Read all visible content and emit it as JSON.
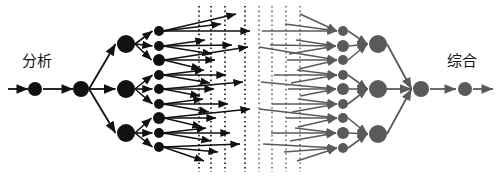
{
  "figure": {
    "title_left": "分析",
    "title_right": "综合",
    "type": "double-tree-divergence-convergence",
    "colors": {
      "analysis": "#111111",
      "synthesis": "#5a5a5a",
      "divider_left": "#111111",
      "divider_right": "#6e6e6e",
      "background": "#ffffff"
    }
  },
  "labels": {
    "left": {
      "text": "分析",
      "x": 22,
      "y": 54
    },
    "right": {
      "text": "综合",
      "x": 447,
      "y": 54
    }
  },
  "chart_data": {
    "type": "diagram",
    "analysis_side": {
      "color": "#111111",
      "entry_arrow": {
        "x1": 8,
        "x2": 28,
        "y": 89
      },
      "level0": {
        "cx": 35,
        "cy": 89,
        "r": 7
      },
      "link_0_1": {
        "x1": 43,
        "x2": 73,
        "y": 89
      },
      "level1": {
        "cx": 81,
        "cy": 89,
        "r": 8
      },
      "level2": [
        {
          "cx": 126,
          "cy": 44,
          "r": 9
        },
        {
          "cx": 126,
          "cy": 89,
          "r": 9
        },
        {
          "cx": 126,
          "cy": 133,
          "r": 9
        }
      ],
      "level3": [
        {
          "cx": 159,
          "cy": 31,
          "r": 5
        },
        {
          "cx": 159,
          "cy": 46,
          "r": 5
        },
        {
          "cx": 159,
          "cy": 60,
          "r": 6
        },
        {
          "cx": 159,
          "cy": 75,
          "r": 5
        },
        {
          "cx": 159,
          "cy": 89,
          "r": 5
        },
        {
          "cx": 159,
          "cy": 104,
          "r": 5
        },
        {
          "cx": 159,
          "cy": 118,
          "r": 6
        },
        {
          "cx": 159,
          "cy": 133,
          "r": 5
        },
        {
          "cx": 159,
          "cy": 147,
          "r": 5
        }
      ],
      "fanout_endpoints": [
        [
          {
            "x": 236,
            "y": 14
          },
          {
            "x": 221,
            "y": 24
          },
          {
            "x": 250,
            "y": 31
          }
        ],
        [
          {
            "x": 205,
            "y": 40
          },
          {
            "x": 232,
            "y": 45
          },
          {
            "x": 212,
            "y": 54
          }
        ],
        [
          {
            "x": 248,
            "y": 47
          },
          {
            "x": 215,
            "y": 60
          },
          {
            "x": 201,
            "y": 69
          }
        ],
        [
          {
            "x": 204,
            "y": 70
          },
          {
            "x": 226,
            "y": 75
          },
          {
            "x": 210,
            "y": 83
          }
        ],
        [
          {
            "x": 243,
            "y": 82
          },
          {
            "x": 214,
            "y": 89
          },
          {
            "x": 200,
            "y": 96
          }
        ],
        [
          {
            "x": 203,
            "y": 99
          },
          {
            "x": 228,
            "y": 104
          },
          {
            "x": 209,
            "y": 112
          }
        ],
        [
          {
            "x": 250,
            "y": 109
          },
          {
            "x": 216,
            "y": 118
          },
          {
            "x": 202,
            "y": 127
          }
        ],
        [
          {
            "x": 206,
            "y": 128
          },
          {
            "x": 230,
            "y": 133
          },
          {
            "x": 211,
            "y": 141
          }
        ],
        [
          {
            "x": 240,
            "y": 144
          },
          {
            "x": 218,
            "y": 152
          },
          {
            "x": 204,
            "y": 161
          }
        ]
      ],
      "divider_lines_x": [
        199,
        211,
        225,
        245
      ]
    },
    "synthesis_side": {
      "color": "#5a5a5a",
      "divider_lines_x": [
        259,
        272,
        286,
        300
      ],
      "fanin_startpoints": [
        [
          {
            "x": 300,
            "y": 14
          },
          {
            "x": 285,
            "y": 24
          },
          {
            "x": 262,
            "y": 31
          }
        ],
        [
          {
            "x": 296,
            "y": 40
          },
          {
            "x": 270,
            "y": 45
          },
          {
            "x": 289,
            "y": 54
          }
        ],
        [
          {
            "x": 259,
            "y": 47
          },
          {
            "x": 287,
            "y": 60
          },
          {
            "x": 299,
            "y": 69
          }
        ],
        [
          {
            "x": 297,
            "y": 70
          },
          {
            "x": 274,
            "y": 75
          },
          {
            "x": 291,
            "y": 83
          }
        ],
        [
          {
            "x": 261,
            "y": 82
          },
          {
            "x": 288,
            "y": 89
          },
          {
            "x": 300,
            "y": 96
          }
        ],
        [
          {
            "x": 298,
            "y": 99
          },
          {
            "x": 272,
            "y": 104
          },
          {
            "x": 292,
            "y": 112
          }
        ],
        [
          {
            "x": 259,
            "y": 109
          },
          {
            "x": 286,
            "y": 118
          },
          {
            "x": 298,
            "y": 127
          }
        ],
        [
          {
            "x": 295,
            "y": 128
          },
          {
            "x": 271,
            "y": 133
          },
          {
            "x": 290,
            "y": 141
          }
        ],
        [
          {
            "x": 263,
            "y": 144
          },
          {
            "x": 284,
            "y": 152
          },
          {
            "x": 297,
            "y": 161
          }
        ]
      ],
      "level3": [
        {
          "cx": 343,
          "cy": 31,
          "r": 5
        },
        {
          "cx": 343,
          "cy": 46,
          "r": 6
        },
        {
          "cx": 343,
          "cy": 60,
          "r": 5
        },
        {
          "cx": 343,
          "cy": 75,
          "r": 5
        },
        {
          "cx": 343,
          "cy": 89,
          "r": 6
        },
        {
          "cx": 343,
          "cy": 104,
          "r": 5
        },
        {
          "cx": 343,
          "cy": 118,
          "r": 5
        },
        {
          "cx": 343,
          "cy": 133,
          "r": 6
        },
        {
          "cx": 343,
          "cy": 148,
          "r": 5
        }
      ],
      "level2": [
        {
          "cx": 378,
          "cy": 44,
          "r": 9
        },
        {
          "cx": 378,
          "cy": 89,
          "r": 9
        },
        {
          "cx": 378,
          "cy": 134,
          "r": 9
        }
      ],
      "level1": {
        "cx": 421,
        "cy": 89,
        "r": 8
      },
      "link_1_0": {
        "x1": 430,
        "x2": 456,
        "y": 89
      },
      "level0": {
        "cx": 465,
        "cy": 89,
        "r": 7
      },
      "exit_arrow": {
        "x1": 473,
        "x2": 493,
        "y": 89
      }
    }
  }
}
